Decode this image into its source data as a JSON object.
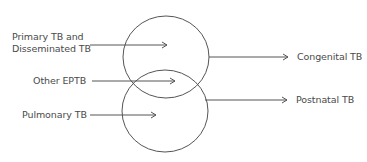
{
  "diagram": {
    "left_labels": {
      "primary_line1": "Primary TB and",
      "primary_line2": "Disseminated TB",
      "other_eptb": "Other EPTB",
      "pulmonary": "Pulmonary TB"
    },
    "right_labels": {
      "congenital": "Congenital TB",
      "postnatal": "Postnatal TB"
    },
    "circles": [
      {
        "name": "congenital-circle",
        "cx": 166,
        "cy": 57,
        "rx": 43,
        "ry": 41
      },
      {
        "name": "postnatal-circle",
        "cx": 165,
        "cy": 111,
        "rx": 43,
        "ry": 41
      }
    ],
    "line_color": "#555555",
    "text_color": "#4a4a4a"
  }
}
